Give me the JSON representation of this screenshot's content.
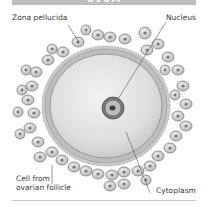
{
  "title": "OVUM",
  "labels": {
    "zona_pellucida": "Zona pellucida",
    "nucleus": "Nucleus",
    "cell_from_follicle_line1": "Cell from",
    "cell_from_follicle_line2": "ovarian follicle",
    "cytoplasm": "Cytoplasm"
  },
  "colors": {
    "title_bar": "#bdbdbd",
    "label_text": "#3a3a3a",
    "cell_fill": "#d6d6d6",
    "cytoplasm_fill": "#e4e4e4",
    "zona_stroke": "#9a9a9a"
  }
}
